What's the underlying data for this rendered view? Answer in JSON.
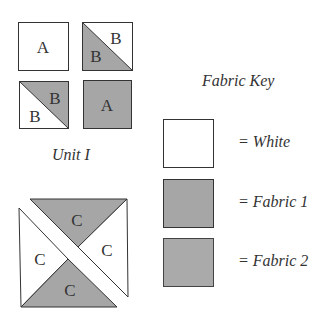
{
  "colors": {
    "white": "#ffffff",
    "fabric1": "#a6a6a6",
    "fabric2": "#aaaaaa",
    "stroke": "#333333"
  },
  "unit1": {
    "title": "Unit I",
    "squares": [
      {
        "id": "top-left",
        "label": "A",
        "fill": "white"
      },
      {
        "id": "top-right",
        "labels": [
          "B",
          "B"
        ],
        "upper_fill": "white",
        "lower_fill": "fabric1"
      },
      {
        "id": "bottom-left",
        "labels": [
          "B",
          "B"
        ],
        "upper_fill": "fabric1",
        "lower_fill": "white"
      },
      {
        "id": "bottom-right",
        "label": "A",
        "fill": "fabric1"
      }
    ]
  },
  "unit2": {
    "triangles": [
      {
        "position": "top",
        "label": "C",
        "fill": "fabric1"
      },
      {
        "position": "right",
        "label": "C",
        "fill": "white"
      },
      {
        "position": "left",
        "label": "C",
        "fill": "white"
      },
      {
        "position": "bottom",
        "label": "C",
        "fill": "fabric1"
      }
    ]
  },
  "fabric_key": {
    "title": "Fabric Key",
    "items": [
      {
        "label": "= White",
        "fill": "white"
      },
      {
        "label": "= Fabric 1",
        "fill": "fabric1"
      },
      {
        "label": "= Fabric 2",
        "fill": "fabric2"
      }
    ]
  }
}
